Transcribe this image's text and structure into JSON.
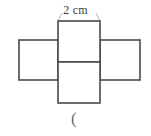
{
  "figure": {
    "kind": "geometry-net-diagram",
    "background_color": "#ffffff",
    "stroke_color": "#4a4a4a",
    "leader_line_color": "#9a9a9a",
    "stroke_width": 1.6,
    "leader_width": 0.7
  },
  "labels": {
    "top_dimension": "2 cm",
    "bottom_marker": "("
  },
  "geometry": {
    "center_column": {
      "x": 58,
      "y": 21,
      "width": 42,
      "height": 82,
      "divider_y": 62
    },
    "left_rect": {
      "x": 19,
      "y": 40,
      "width": 39,
      "height": 40
    },
    "right_rect": {
      "x": 100,
      "y": 40,
      "width": 40,
      "height": 40
    },
    "leader_lines": [
      {
        "x1": 62,
        "y1": 13,
        "x2": 58,
        "y2": 21
      },
      {
        "x1": 96,
        "y1": 13,
        "x2": 100,
        "y2": 21
      }
    ]
  }
}
